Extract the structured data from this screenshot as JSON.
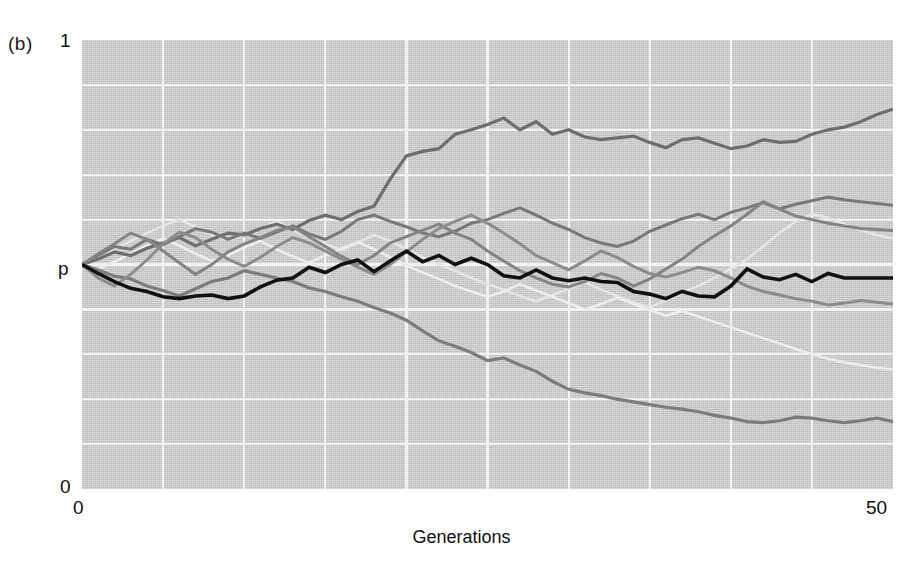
{
  "figure": {
    "panel_label": "(b)",
    "background_color": "#ffffff",
    "plot_background_color": "#c6c6c6",
    "gridline_color": "#f2f2f2"
  },
  "axes": {
    "y_top_label": "1",
    "y_mid_label": "p",
    "y_bottom_label": "0",
    "x_left_label": "0",
    "x_right_label": "50",
    "x_title": "Generations"
  },
  "chart_data": {
    "type": "line",
    "title": "",
    "subtitle": "",
    "xlabel": "Generations",
    "ylabel": "p",
    "xlim": [
      0,
      50
    ],
    "ylim": [
      0,
      1
    ],
    "grid": true,
    "grid_x_divisions": 10,
    "grid_y_divisions": 10,
    "legend": "none",
    "y_tick_labels": [
      "0",
      "p",
      "1"
    ],
    "y_tick_values": [
      0,
      0.5,
      1
    ],
    "x_tick_labels": [
      "0",
      "50"
    ],
    "x_tick_values": [
      0,
      50
    ],
    "annotations": [
      "(b)"
    ],
    "x": [
      0,
      1,
      2,
      3,
      4,
      5,
      6,
      7,
      8,
      9,
      10,
      11,
      12,
      13,
      14,
      15,
      16,
      17,
      18,
      19,
      20,
      21,
      22,
      23,
      24,
      25,
      26,
      27,
      28,
      29,
      30,
      31,
      32,
      33,
      34,
      35,
      36,
      37,
      38,
      39,
      40,
      41,
      42,
      43,
      44,
      45,
      46,
      47,
      48,
      49,
      50
    ],
    "series": [
      {
        "name": "trace-black-focal",
        "color": "#111111",
        "width": 3.6,
        "values": [
          0.5,
          0.48,
          0.462,
          0.447,
          0.44,
          0.428,
          0.424,
          0.43,
          0.432,
          0.424,
          0.43,
          0.45,
          0.465,
          0.47,
          0.494,
          0.482,
          0.5,
          0.51,
          0.484,
          0.508,
          0.53,
          0.506,
          0.52,
          0.5,
          0.514,
          0.5,
          0.475,
          0.47,
          0.488,
          0.47,
          0.464,
          0.47,
          0.462,
          0.46,
          0.44,
          0.434,
          0.424,
          0.44,
          0.43,
          0.428,
          0.452,
          0.49,
          0.472,
          0.466,
          0.478,
          0.462,
          0.48,
          0.47,
          0.47,
          0.47,
          0.47
        ]
      },
      {
        "name": "trace-gray-rising-top",
        "color": "#6e6e6e",
        "width": 3.2,
        "values": [
          0.5,
          0.512,
          0.528,
          0.52,
          0.536,
          0.548,
          0.56,
          0.542,
          0.556,
          0.57,
          0.566,
          0.58,
          0.59,
          0.578,
          0.598,
          0.61,
          0.6,
          0.618,
          0.63,
          0.69,
          0.742,
          0.752,
          0.758,
          0.79,
          0.8,
          0.812,
          0.826,
          0.8,
          0.818,
          0.79,
          0.8,
          0.784,
          0.778,
          0.782,
          0.786,
          0.772,
          0.76,
          0.778,
          0.782,
          0.77,
          0.758,
          0.764,
          0.778,
          0.772,
          0.774,
          0.79,
          0.8,
          0.806,
          0.818,
          0.834,
          0.846
        ]
      },
      {
        "name": "trace-gray-falling-bottom",
        "color": "#7c7c7c",
        "width": 3.2,
        "values": [
          0.5,
          0.488,
          0.474,
          0.468,
          0.452,
          0.442,
          0.43,
          0.446,
          0.462,
          0.47,
          0.486,
          0.478,
          0.47,
          0.462,
          0.448,
          0.44,
          0.428,
          0.418,
          0.404,
          0.392,
          0.376,
          0.352,
          0.33,
          0.318,
          0.304,
          0.286,
          0.292,
          0.276,
          0.262,
          0.24,
          0.222,
          0.214,
          0.208,
          0.2,
          0.194,
          0.188,
          0.182,
          0.178,
          0.172,
          0.164,
          0.158,
          0.15,
          0.148,
          0.152,
          0.16,
          0.158,
          0.152,
          0.148,
          0.152,
          0.158,
          0.15
        ]
      },
      {
        "name": "trace-gray-mid-upper",
        "color": "#787878",
        "width": 3.0,
        "values": [
          0.5,
          0.52,
          0.54,
          0.534,
          0.556,
          0.544,
          0.562,
          0.58,
          0.572,
          0.556,
          0.57,
          0.558,
          0.572,
          0.586,
          0.568,
          0.556,
          0.574,
          0.6,
          0.61,
          0.596,
          0.584,
          0.57,
          0.562,
          0.574,
          0.592,
          0.6,
          0.614,
          0.626,
          0.61,
          0.592,
          0.578,
          0.56,
          0.548,
          0.54,
          0.552,
          0.574,
          0.588,
          0.602,
          0.612,
          0.6,
          0.616,
          0.626,
          0.638,
          0.624,
          0.634,
          0.642,
          0.65,
          0.644,
          0.64,
          0.636,
          0.632
        ]
      },
      {
        "name": "trace-gray-mid-wander",
        "color": "#848484",
        "width": 3.0,
        "values": [
          0.5,
          0.524,
          0.546,
          0.57,
          0.556,
          0.53,
          0.504,
          0.478,
          0.5,
          0.528,
          0.546,
          0.56,
          0.576,
          0.584,
          0.562,
          0.54,
          0.518,
          0.5,
          0.52,
          0.548,
          0.562,
          0.576,
          0.59,
          0.57,
          0.556,
          0.53,
          0.508,
          0.486,
          0.47,
          0.456,
          0.45,
          0.462,
          0.48,
          0.47,
          0.452,
          0.468,
          0.49,
          0.512,
          0.54,
          0.564,
          0.586,
          0.612,
          0.64,
          0.624,
          0.608,
          0.6,
          0.592,
          0.586,
          0.58,
          0.578,
          0.576
        ]
      },
      {
        "name": "trace-gray-crossing",
        "color": "#8c8c8c",
        "width": 3.0,
        "values": [
          0.5,
          0.47,
          0.452,
          0.478,
          0.51,
          0.546,
          0.572,
          0.56,
          0.534,
          0.512,
          0.496,
          0.516,
          0.54,
          0.56,
          0.548,
          0.53,
          0.512,
          0.494,
          0.478,
          0.5,
          0.528,
          0.556,
          0.58,
          0.596,
          0.61,
          0.592,
          0.57,
          0.546,
          0.52,
          0.504,
          0.488,
          0.508,
          0.53,
          0.516,
          0.496,
          0.48,
          0.472,
          0.482,
          0.494,
          0.486,
          0.47,
          0.452,
          0.44,
          0.432,
          0.424,
          0.418,
          0.41,
          0.414,
          0.42,
          0.416,
          0.412
        ]
      },
      {
        "name": "trace-light-upper",
        "color": "#e4e4e4",
        "width": 2.6,
        "values": [
          0.5,
          0.516,
          0.534,
          0.552,
          0.57,
          0.586,
          0.6,
          0.584,
          0.566,
          0.554,
          0.566,
          0.58,
          0.596,
          0.578,
          0.56,
          0.546,
          0.532,
          0.548,
          0.566,
          0.552,
          0.534,
          0.516,
          0.5,
          0.486,
          0.47,
          0.456,
          0.444,
          0.43,
          0.418,
          0.432,
          0.446,
          0.46,
          0.444,
          0.43,
          0.416,
          0.404,
          0.42,
          0.436,
          0.452,
          0.47,
          0.49,
          0.512,
          0.54,
          0.57,
          0.596,
          0.612,
          0.604,
          0.59,
          0.576,
          0.566,
          0.558
        ]
      },
      {
        "name": "trace-light-lower",
        "color": "#ededed",
        "width": 2.6,
        "values": [
          0.5,
          0.49,
          0.506,
          0.524,
          0.542,
          0.558,
          0.542,
          0.524,
          0.508,
          0.52,
          0.538,
          0.552,
          0.534,
          0.518,
          0.504,
          0.52,
          0.536,
          0.55,
          0.534,
          0.516,
          0.498,
          0.482,
          0.468,
          0.452,
          0.44,
          0.428,
          0.44,
          0.456,
          0.442,
          0.428,
          0.414,
          0.4,
          0.412,
          0.426,
          0.412,
          0.398,
          0.386,
          0.396,
          0.384,
          0.372,
          0.36,
          0.348,
          0.336,
          0.324,
          0.312,
          0.3,
          0.29,
          0.282,
          0.276,
          0.27,
          0.266
        ]
      }
    ]
  }
}
